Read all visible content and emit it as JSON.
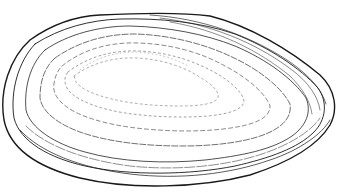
{
  "image": {
    "subject": "shell-line-drawing",
    "background": "#ffffff",
    "ink": "#1a1a1a"
  }
}
